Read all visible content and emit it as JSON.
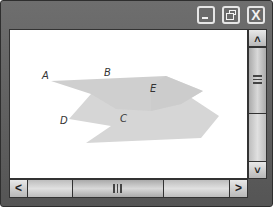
{
  "window": {
    "titlebar": {
      "buttons": [
        {
          "name": "minimize",
          "icon": "minimize-icon"
        },
        {
          "name": "maximize",
          "icon": "restore-icon"
        },
        {
          "name": "close",
          "icon": "close-icon",
          "glyph": "X"
        }
      ]
    },
    "figure": {
      "points": [
        {
          "label": "A",
          "x": 45,
          "y": 77
        },
        {
          "label": "B",
          "x": 106,
          "y": 74
        },
        {
          "label": "E",
          "x": 152,
          "y": 90
        },
        {
          "label": "D",
          "x": 62,
          "y": 122
        },
        {
          "label": "C",
          "x": 122,
          "y": 119
        }
      ],
      "fill_color": "#d2d2d2"
    },
    "vertical_scrollbar": {
      "up_glyph": "˄",
      "down_glyph": "˅"
    },
    "horizontal_scrollbar": {
      "left_glyph": "<",
      "right_glyph": ">"
    }
  }
}
